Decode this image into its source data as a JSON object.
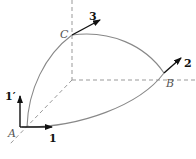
{
  "diagram": {
    "points": {
      "A": {
        "label": "A",
        "x": 20,
        "y": 127
      },
      "B": {
        "label": "B",
        "x": 164,
        "y": 73
      },
      "C": {
        "label": "C",
        "x": 72,
        "y": 35
      },
      "corner": {
        "x": 72,
        "y": 80
      }
    },
    "vectors": {
      "v1": {
        "label": "1"
      },
      "v1p": {
        "label": "1′"
      },
      "v2": {
        "label": "2"
      },
      "v3": {
        "label": "3"
      }
    },
    "colors": {
      "curve": "#888888",
      "dashed": "#888888",
      "arrow": "#111111"
    }
  }
}
